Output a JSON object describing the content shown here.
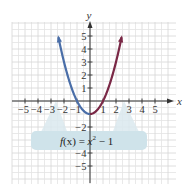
{
  "chart_data": {
    "type": "line",
    "title": "",
    "xlabel": "x",
    "ylabel": "y",
    "xlim": [
      -5.5,
      5.5
    ],
    "ylim": [
      -5.5,
      5.5
    ],
    "grid": true,
    "x_ticks": [
      -5,
      -4,
      -3,
      -2,
      -1,
      1,
      2,
      3,
      4,
      5
    ],
    "y_ticks": [
      -5,
      -4,
      -2,
      1,
      2,
      3,
      4,
      5
    ],
    "x_tick_labels": [
      "−5",
      "−4",
      "−3",
      "−2",
      "−1",
      "1",
      "2",
      "3",
      "4",
      "5"
    ],
    "y_tick_labels": [
      "−5",
      "−4",
      "−2",
      "1",
      "2",
      "3",
      "4",
      "5"
    ],
    "series": [
      {
        "name": "f(x) = x^2 − 1 (left branch, x ≤ 0)",
        "color": "#4a6ea8",
        "x": [
          -2.55,
          -2,
          -1.5,
          -1,
          -0.5,
          0
        ],
        "y": [
          5.5,
          3,
          1.25,
          0,
          -0.75,
          -1
        ]
      },
      {
        "name": "f(x) = x^2 − 1 (right branch, x ≥ 0)",
        "color": "#7a2846",
        "x": [
          0,
          0.5,
          1,
          1.5,
          2,
          2.55
        ],
        "y": [
          -1,
          -0.75,
          0,
          1.25,
          3,
          5.5
        ]
      }
    ],
    "annotations": [
      {
        "text": "f(x) = x² − 1",
        "box_color": "#cfe3ea",
        "points_to": [
          [
            -2.2,
            0
          ],
          [
            2.2,
            0
          ]
        ]
      }
    ]
  },
  "labels": {
    "x_axis": "x",
    "y_axis": "y",
    "function_f": "f",
    "function_arg": "(x) = ",
    "function_var": "x",
    "function_exp": "2",
    "function_rest": " − 1"
  },
  "colors": {
    "grid": "#e2e2e2",
    "axis": "#333333",
    "curve_left": "#4a6ea8",
    "curve_right": "#7a2846",
    "callout": "#cfe3ea"
  }
}
